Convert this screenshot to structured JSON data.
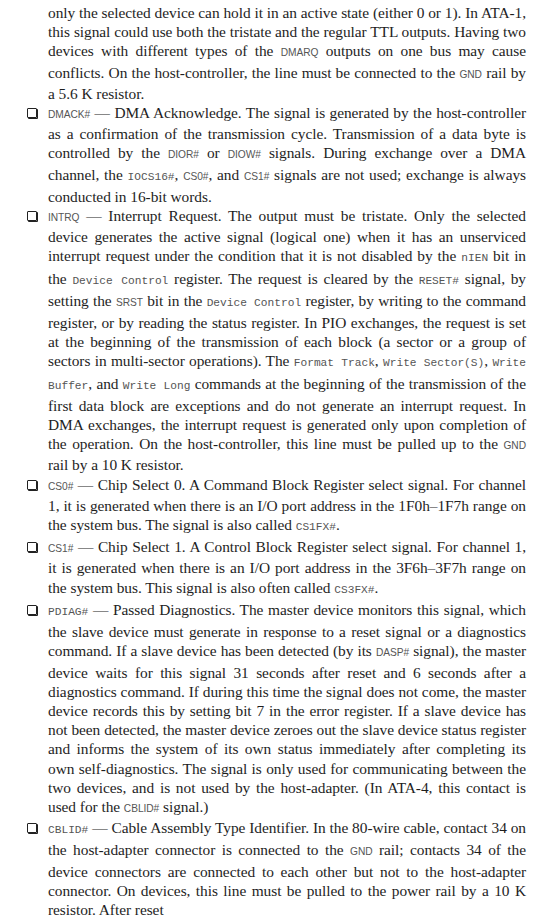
{
  "intro": {
    "t1": "only the selected device can hold it in an active state (either 0 or 1). In ATA-1, this signal could use both the tristate and the regular TTL outputs. Having two devices with different types of the ",
    "c1": "DMARQ",
    "t2": " outputs on one bus may cause conflicts. On the host-controller, the line must be connected to the ",
    "c2": "GND",
    "t3": " rail by a 5.6 K resistor."
  },
  "items": [
    {
      "signal": "DMACK#",
      "t1": " — DMA Acknowledge. The signal is generated by the host-controller as a confirmation of the transmission cycle. Transmission of a data byte is controlled by the ",
      "c1": "DIOR#",
      "t2": " or ",
      "c2": "DIOW#",
      "t3": " signals. During exchange over a DMA channel, the ",
      "c3": "IOCS16#",
      "t4": ", ",
      "c4": "CS0#",
      "t5": ", and ",
      "c5": "CS1#",
      "t6": " signals are not used; exchange is always conducted in 16-bit words."
    },
    {
      "signal": "INTRQ",
      "t1": " — Interrupt Request. The output must be tristate. Only the selected device generates the active signal (logical one) when it has an unserviced interrupt request under the condition that it is not disabled by the ",
      "c1": "nIEN",
      "t2": " bit in the ",
      "c2": "Device Control",
      "t3": " register. The request is cleared by the ",
      "c3": "RESET#",
      "t4": " signal, by setting the ",
      "c4": "SRST",
      "t5": " bit in the ",
      "c5": "Device Control",
      "t6": " register, by writing to the command register, or by reading the status register. In PIO exchanges, the request is set at the beginning of the transmission of each block (a sector or a group of sectors in multi-sector operations). The ",
      "c6": "Format Track",
      "t7": ", ",
      "c7": "Write Sector(S)",
      "t8": ", ",
      "c8": "Write Buffer",
      "t9": ", and ",
      "c9": "Write Long",
      "t10": " commands at the beginning of the transmission of the first data block are exceptions and do not generate an interrupt request. In DMA exchanges, the interrupt request is generated only upon completion of the operation. On the host-controller, this line must be pulled up to the ",
      "c10": "GND",
      "t11": " rail by a 10 K resistor."
    },
    {
      "signal": "CS0#",
      "t1": " — Chip Select 0. A Command Block Register select signal. For channel 1, it is generated when there is an I/O port address in the 1F0h–1F7h range on the system bus. The signal is also called ",
      "c1": "CS1FX#",
      "t2": "."
    },
    {
      "signal": "CS1#",
      "t1": " — Chip Select 1. A Control Block Register select signal. For channel 1, it is generated when there is an I/O port address in the 3F6h–3F7h range on the system bus. This signal is also often called ",
      "c1": "CS3FX#",
      "t2": "."
    },
    {
      "signal": "PDIAG#",
      "t1": " — Passed Diagnostics. The master device monitors this signal, which the slave device must generate in response to a reset signal or a diagnostics command. If a slave device has been detected (by its ",
      "c1": "DASP#",
      "t2": " signal), the master device waits for this signal 31 seconds after reset and 6 seconds after a diagnostics command. If during this time the signal does not come, the master device records this by setting bit 7 in the error register. If a slave device has not been detected, the master device zeroes out the slave device status register and informs the system of its own status immediately after completing its own self-diagnostics. The signal is only used for communicating between the two devices, and is not used by the host-adapter. (In ATA-4, this contact is used for the ",
      "c2": "CBLID#",
      "t3": " signal.)"
    },
    {
      "signal": "CBLID#",
      "t1": " — Cable Assembly Type Identifier. In the 80-wire cable, contact 34 on the host-adapter connector is connected to the ",
      "c1": "GND",
      "t2": " rail; contacts 34 of the device connectors are connected to each other but not to the host-adapter connector. On devices, this line must be pulled to the power rail by a 10 K resistor. After reset"
    }
  ]
}
